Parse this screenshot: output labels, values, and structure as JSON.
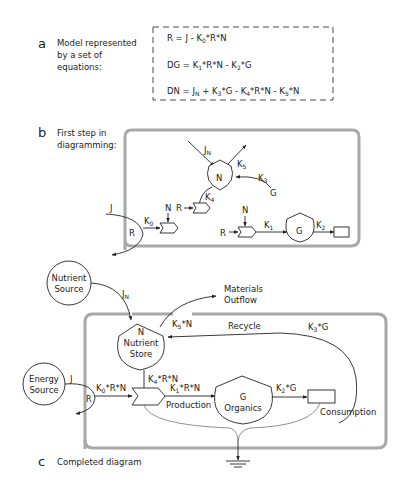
{
  "section_a": {
    "letter": "a",
    "caption_lines": [
      "Model represented",
      "by a set of",
      "equations:"
    ],
    "equations": [
      {
        "lhs": "R = J - K",
        "parts": [
          [
            "R = J - K",
            ""
          ],
          [
            "0",
            "sub"
          ],
          [
            "*R*N",
            ""
          ]
        ]
      },
      {
        "parts": [
          [
            "DG = K",
            ""
          ],
          [
            "1",
            "sub"
          ],
          [
            "*R*N - K",
            ""
          ],
          [
            "2",
            "sub"
          ],
          [
            "*G",
            ""
          ]
        ]
      },
      {
        "parts": [
          [
            "DN = J",
            ""
          ],
          [
            "N",
            "sub"
          ],
          [
            " + K",
            ""
          ],
          [
            "3",
            "sub"
          ],
          [
            "*G - K",
            ""
          ],
          [
            "4",
            "sub"
          ],
          [
            "*R*N - K",
            ""
          ],
          [
            "5",
            "sub"
          ],
          [
            "*N",
            ""
          ]
        ]
      }
    ],
    "eq1": {
      "a": "R = J - K",
      "s1": "0",
      "b": "*R*N"
    },
    "eq2": {
      "a": "DG = K",
      "s1": "1",
      "b": "*R*N - K",
      "s2": "2",
      "c": "*G"
    },
    "eq3": {
      "a": "DN = J",
      "s1": "N",
      "b": " + K",
      "s2": "3",
      "c": "*G - K",
      "s3": "4",
      "d": "*R*N - K",
      "s4": "5",
      "e": "*N"
    }
  },
  "section_b": {
    "letter": "b",
    "caption_lines": [
      "First step in",
      "diagramming:"
    ],
    "labels": {
      "jn": "J",
      "jn_sub": "N",
      "k5": "K",
      "k5_sub": "5",
      "n_store": "N",
      "k3": "K",
      "k3_sub": "3",
      "g_src": "G",
      "k4": "K",
      "k4_sub": "4",
      "r_in1": "R",
      "j": "J",
      "r_source": "R",
      "k0": "K",
      "k0_sub": "0",
      "n_in1": "N",
      "n_in2": "N",
      "r_in2": "R",
      "k1": "K",
      "k1_sub": "1",
      "g_store": "G",
      "k2": "K",
      "k2_sub": "2"
    }
  },
  "section_c": {
    "letter": "c",
    "caption": "Completed diagram",
    "nutrient_source": [
      "Nutrient",
      "Source"
    ],
    "jn": "J",
    "jn_sub": "N",
    "materials_outflow": [
      "Materials",
      "Outflow"
    ],
    "k5n": {
      "a": "K",
      "s": "5",
      "b": "*N"
    },
    "recycle": "Recycle",
    "k3g": {
      "a": "K",
      "s": "3",
      "b": "*G"
    },
    "nutrient_store": [
      "N",
      "Nutrient",
      "Store"
    ],
    "k4rn": {
      "a": "K",
      "s": "4",
      "b": "*R*N"
    },
    "energy_source": [
      "Energy",
      "Source"
    ],
    "j": "J",
    "r": "R",
    "k0rn": {
      "a": "K",
      "s": "0",
      "b": "*R*N"
    },
    "k1rn": {
      "a": "K",
      "s": "1",
      "b": "*R*N"
    },
    "production": "Production",
    "organics": [
      "G",
      "Organics"
    ],
    "k2g": {
      "a": "K",
      "s": "2",
      "b": "*G"
    },
    "consumption": "Consumption"
  }
}
